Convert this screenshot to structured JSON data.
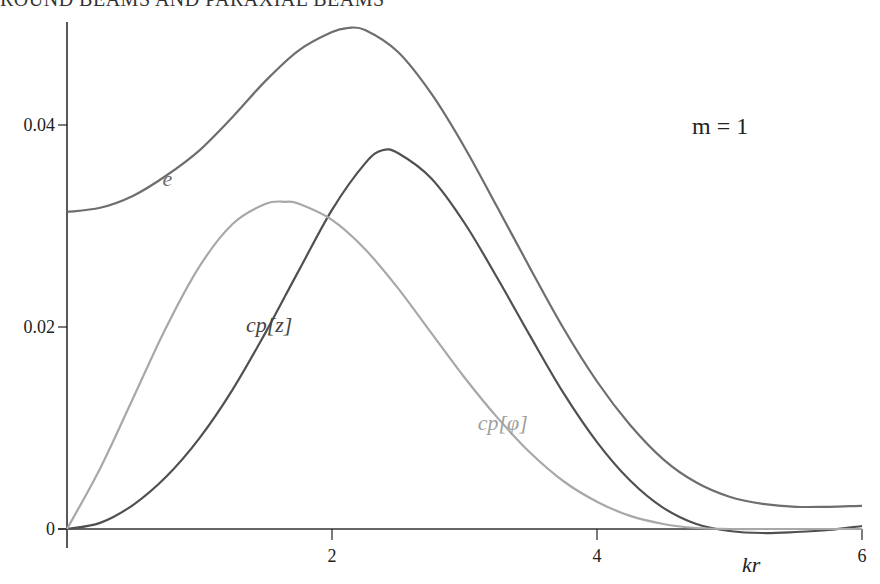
{
  "header": {
    "text": "ROUND BEAMS AND PARAXIAL BEAMS"
  },
  "chart_data": {
    "type": "line",
    "title": "",
    "xlabel": "kr",
    "ylabel": "",
    "xlim": [
      0,
      6
    ],
    "ylim": [
      0,
      0.05
    ],
    "x_ticks": [
      "2",
      "4",
      "6"
    ],
    "y_ticks": [
      "0",
      "0.02",
      "0.04"
    ],
    "grid": false,
    "annotation": "m = 1",
    "series": [
      {
        "name": "e",
        "color": "#6e6e6e",
        "x": [
          0,
          0.25,
          0.5,
          0.75,
          1.0,
          1.25,
          1.5,
          1.75,
          2.0,
          2.12,
          2.25,
          2.5,
          2.75,
          3.0,
          3.25,
          3.5,
          3.75,
          4.0,
          4.25,
          4.5,
          4.75,
          5.0,
          5.25,
          5.5,
          5.75,
          6.0
        ],
        "values": [
          0.0314,
          0.0318,
          0.033,
          0.035,
          0.0375,
          0.0408,
          0.0444,
          0.0474,
          0.0492,
          0.0496,
          0.0494,
          0.0472,
          0.0431,
          0.0378,
          0.0318,
          0.0257,
          0.0198,
          0.0146,
          0.0103,
          0.0069,
          0.0046,
          0.0032,
          0.0025,
          0.0022,
          0.0022,
          0.0023
        ]
      },
      {
        "name": "cp[z]",
        "color": "#505050",
        "x": [
          0,
          0.25,
          0.5,
          0.75,
          1.0,
          1.25,
          1.5,
          1.75,
          2.0,
          2.25,
          2.38,
          2.5,
          2.75,
          3.0,
          3.25,
          3.5,
          3.75,
          4.0,
          4.25,
          4.5,
          4.75,
          5.0,
          5.25,
          5.5,
          5.75,
          6.0
        ],
        "values": [
          0.0,
          0.0006,
          0.0024,
          0.0052,
          0.009,
          0.0138,
          0.0195,
          0.0256,
          0.0316,
          0.0362,
          0.0375,
          0.0372,
          0.0347,
          0.0303,
          0.0248,
          0.019,
          0.0134,
          0.0086,
          0.0048,
          0.0021,
          0.0005,
          -0.0002,
          -0.0004,
          -0.0003,
          -0.0001,
          0.0003
        ]
      },
      {
        "name": "cp[φ]",
        "color": "#a8a8a8",
        "x": [
          0,
          0.25,
          0.5,
          0.75,
          1.0,
          1.25,
          1.5,
          1.65,
          1.75,
          2.0,
          2.25,
          2.5,
          2.75,
          3.0,
          3.25,
          3.5,
          3.75,
          4.0,
          4.25,
          4.5,
          4.75,
          5.0,
          5.25,
          5.5,
          5.75,
          6.0
        ],
        "values": [
          0.0,
          0.006,
          0.013,
          0.02,
          0.026,
          0.0302,
          0.0322,
          0.0324,
          0.0322,
          0.0306,
          0.0277,
          0.0238,
          0.0194,
          0.015,
          0.011,
          0.0075,
          0.0047,
          0.0027,
          0.0013,
          0.0005,
          0.0001,
          0.0,
          0.0,
          0.0,
          0.0,
          0.0
        ]
      }
    ],
    "labels": [
      {
        "text": "e",
        "kr": 0.72,
        "y": 0.034
      },
      {
        "text": "cp[z]",
        "kr": 1.35,
        "y": 0.0195
      },
      {
        "text": "cp[φ]",
        "kr": 3.1,
        "y": 0.0098
      }
    ]
  }
}
